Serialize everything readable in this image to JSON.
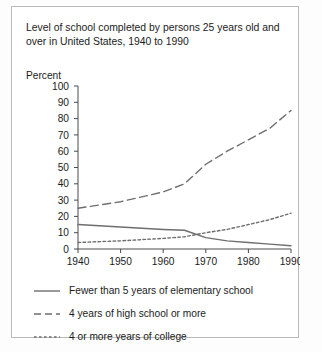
{
  "title": "Level of school completed by persons 25 years old and over in United States, 1940 to 1990",
  "axis_note": "Percent",
  "colors": {
    "border": "#b9b9b9",
    "background": "#ffffff",
    "axis": "#4a4a4a",
    "series": "#6e6e6e",
    "text": "#1b1b1b"
  },
  "legend": {
    "items": [
      {
        "label": "Fewer than 5 years of elementary school",
        "style": "solid"
      },
      {
        "label": "4 years of high school or more",
        "style": "dashed"
      },
      {
        "label": "4 or more years of college",
        "style": "dotted"
      }
    ]
  },
  "chart_data": {
    "type": "line",
    "title": "Level of school completed by persons 25 years old and over in United States, 1940 to 1990",
    "xlabel": "",
    "ylabel": "Percent",
    "xlim": [
      1940,
      1990
    ],
    "ylim": [
      0,
      100
    ],
    "ytick_step": 10,
    "grid": false,
    "legend_position": "below",
    "xticks": [
      1940,
      1950,
      1960,
      1970,
      1980,
      1990
    ],
    "xtick_labels": [
      "1940",
      "1950",
      "1960",
      "1970",
      "1980",
      "1990"
    ],
    "yticks": [
      0,
      10,
      20,
      30,
      40,
      50,
      60,
      70,
      80,
      90,
      100
    ],
    "ytick_labels": [
      "0",
      "10",
      "20",
      "30",
      "40",
      "50",
      "60",
      "70",
      "80",
      "90",
      "100"
    ],
    "x": [
      1940,
      1950,
      1960,
      1965,
      1970,
      1975,
      1980,
      1985,
      1990
    ],
    "series": [
      {
        "name": "Fewer than 5 years of elementary school",
        "style": "solid",
        "values": [
          15,
          13.5,
          12,
          11.5,
          7,
          5,
          4,
          3,
          2
        ]
      },
      {
        "name": "4 years of high school or more",
        "style": "dashed",
        "values": [
          25,
          29,
          35,
          40,
          52,
          60,
          67,
          74,
          85
        ]
      },
      {
        "name": "4 or more years of college",
        "style": "dotted",
        "values": [
          4,
          5,
          6.5,
          7.5,
          10,
          12,
          15,
          18,
          22
        ]
      }
    ]
  }
}
